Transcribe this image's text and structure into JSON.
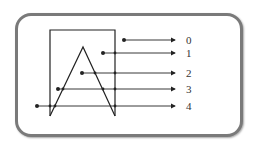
{
  "diagram": {
    "title": "",
    "rectangle": {
      "x1": 50,
      "y1": 30,
      "x2": 115,
      "y2": 116
    },
    "triangle": {
      "apex": [
        83,
        47
      ],
      "base_left": [
        50,
        116
      ],
      "base_right": [
        115,
        116
      ]
    },
    "rays": [
      {
        "label": "0",
        "start": [
          124,
          40
        ],
        "y": 40,
        "crossings": []
      },
      {
        "label": "1",
        "start": [
          103,
          53
        ],
        "y": 53,
        "crossings": [
          115
        ]
      },
      {
        "label": "2",
        "start": [
          82,
          73
        ],
        "y": 73,
        "crossings": [
          95,
          115
        ]
      },
      {
        "label": "3",
        "start": [
          58,
          89
        ],
        "y": 89,
        "crossings": [
          63,
          103,
          115
        ]
      },
      {
        "label": "4",
        "start": [
          37,
          106
        ],
        "y": 106,
        "crossings": [
          50,
          55,
          115
        ]
      }
    ],
    "arrow_end_x": 175,
    "label_x": 186,
    "colors": {
      "line": "#222222",
      "frame": "#7a7a7a",
      "label": "#333333"
    }
  }
}
